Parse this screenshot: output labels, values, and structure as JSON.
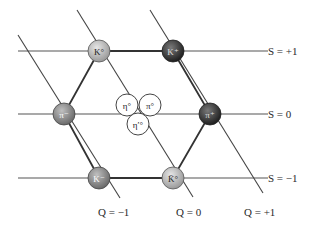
{
  "diagram": {
    "strangeness_lines": [
      {
        "label": "S = +1",
        "y": 51
      },
      {
        "label": "S = 0",
        "y": 114
      },
      {
        "label": "S = −1",
        "y": 178
      }
    ],
    "charge_lines": [
      {
        "label": "Q = −1"
      },
      {
        "label": "Q = 0"
      },
      {
        "label": "Q = +1"
      }
    ],
    "particles": [
      {
        "name": "K0",
        "symbol": "K°",
        "shade": "light"
      },
      {
        "name": "K+",
        "symbol": "K⁺",
        "shade": "dark"
      },
      {
        "name": "pi-",
        "symbol": "π⁻",
        "shade": "medium"
      },
      {
        "name": "pi+",
        "symbol": "π⁺",
        "shade": "dark"
      },
      {
        "name": "K-",
        "symbol": "K⁻",
        "shade": "medium"
      },
      {
        "name": "K0bar",
        "symbol": "K̄°",
        "shade": "light"
      },
      {
        "name": "eta0",
        "symbol": "η°",
        "shade": "white"
      },
      {
        "name": "pi0",
        "symbol": "π°",
        "shade": "white"
      },
      {
        "name": "eta-prime",
        "symbol": "η′°",
        "shade": "white"
      }
    ],
    "colors": {
      "line": "#444444",
      "light_node": "#b5b5b5",
      "medium_node": "#8a8a8a",
      "dark_node": "#3a3a3a",
      "white_node": "#ffffff"
    }
  }
}
